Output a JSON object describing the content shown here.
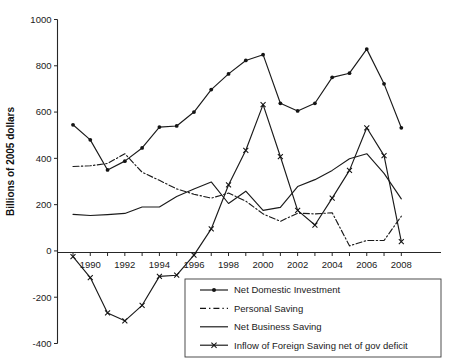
{
  "chart_data": {
    "type": "line",
    "title": "",
    "xlabel": "",
    "ylabel": "Billions of 2005 dollars",
    "ylim": [
      -400,
      1000
    ],
    "xlim": [
      1989,
      2008
    ],
    "grid": false,
    "legend_position": "bottom-right",
    "ytick_labels": [
      "1000",
      "800",
      "600",
      "400",
      "200",
      "0",
      "-200",
      "-400"
    ],
    "yticks": [
      1000,
      800,
      600,
      400,
      200,
      0,
      -200,
      -400
    ],
    "xtick_labels": [
      "1990",
      "1992",
      "1994",
      "1996",
      "1998",
      "2000",
      "2002",
      "2004",
      "2006",
      "2008"
    ],
    "xticks": [
      1990,
      1992,
      1994,
      1996,
      1998,
      2000,
      2002,
      2004,
      2006,
      2008
    ],
    "x": [
      1989,
      1990,
      1991,
      1992,
      1993,
      1994,
      1995,
      1996,
      1997,
      1998,
      1999,
      2000,
      2001,
      2002,
      2003,
      2004,
      2005,
      2006,
      2007,
      2008
    ],
    "series": [
      {
        "name": "Net  Domestic Investment",
        "marker": "diamond",
        "line_style": "solid",
        "color": "#141414",
        "values": [
          545,
          480,
          350,
          388,
          445,
          535,
          540,
          600,
          697,
          765,
          823,
          848,
          638,
          605,
          638,
          750,
          768,
          872,
          722,
          532
        ]
      },
      {
        "name": "Personal Saving",
        "marker": "none",
        "line_style": "dash-dot",
        "color": "#141414",
        "values": [
          365,
          368,
          378,
          420,
          340,
          305,
          268,
          245,
          228,
          250,
          215,
          160,
          128,
          163,
          160,
          165,
          22,
          45,
          45,
          150
        ]
      },
      {
        "name": "Net Business Saving",
        "marker": "none",
        "line_style": "solid",
        "color": "#141414",
        "values": [
          158,
          153,
          157,
          162,
          190,
          190,
          235,
          268,
          298,
          205,
          258,
          175,
          188,
          278,
          308,
          348,
          398,
          420,
          335,
          225
        ]
      },
      {
        "name": "Inflow of Foreign Saving net of gov deficit",
        "marker": "x",
        "line_style": "solid",
        "color": "#141414",
        "values": [
          -25,
          -115,
          -268,
          -302,
          -235,
          -110,
          -105,
          -18,
          95,
          285,
          435,
          632,
          408,
          175,
          112,
          228,
          348,
          532,
          412,
          40
        ]
      }
    ]
  },
  "legend": {
    "items": [
      {
        "label": "Net  Domestic Investment",
        "marker": "diamond",
        "style": "solid"
      },
      {
        "label": "Personal Saving",
        "marker": "none",
        "style": "dashed"
      },
      {
        "label": "Net Business Saving",
        "marker": "none",
        "style": "solid"
      },
      {
        "label": "Inflow of Foreign Saving net of gov deficit",
        "marker": "x",
        "style": "solid"
      }
    ]
  }
}
